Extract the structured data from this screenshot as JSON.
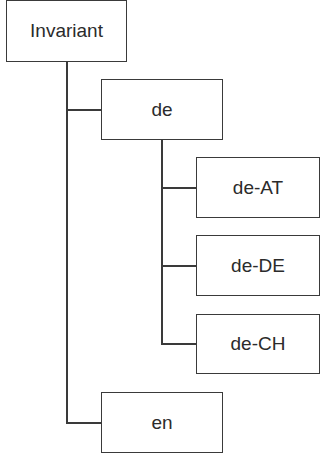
{
  "diagram": {
    "type": "tree",
    "title": "",
    "nodes": [
      {
        "id": "invariant",
        "label": "Invariant",
        "parent": null
      },
      {
        "id": "de",
        "label": "de",
        "parent": "invariant"
      },
      {
        "id": "de-AT",
        "label": "de-AT",
        "parent": "de"
      },
      {
        "id": "de-DE",
        "label": "de-DE",
        "parent": "de"
      },
      {
        "id": "de-CH",
        "label": "de-CH",
        "parent": "de"
      },
      {
        "id": "en",
        "label": "en",
        "parent": "invariant"
      }
    ],
    "colors": {
      "line": "#3a3a3a",
      "text": "#2b2b2b",
      "box_fill": "#ffffff"
    }
  }
}
